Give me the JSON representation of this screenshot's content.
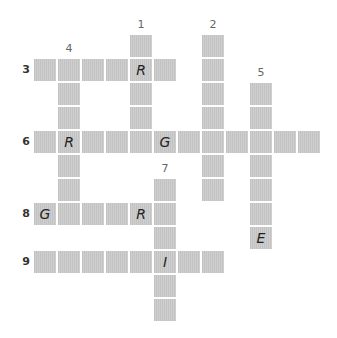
{
  "puzzle": {
    "grid": {
      "origin_x": 34,
      "origin_y": 35,
      "pitch": 24,
      "cell_size": 22
    },
    "colors": {
      "cell": "#c9c9c9",
      "letter": "#222222",
      "number": "#666666"
    },
    "entries": [
      {
        "number": "1",
        "direction": "down",
        "row": 0,
        "col": 4,
        "length": 5,
        "letters": {
          "1": "R"
        }
      },
      {
        "number": "2",
        "direction": "down",
        "row": 0,
        "col": 7,
        "length": 7,
        "letters": {}
      },
      {
        "number": "3",
        "direction": "across",
        "row": 1,
        "col": 0,
        "length": 6,
        "letters": {
          "4": "R"
        }
      },
      {
        "number": "4",
        "direction": "down",
        "row": 1,
        "col": 1,
        "length": 7,
        "letters": {
          "3": "R"
        }
      },
      {
        "number": "5",
        "direction": "down",
        "row": 2,
        "col": 9,
        "length": 7,
        "letters": {
          "6": "E"
        }
      },
      {
        "number": "6",
        "direction": "across",
        "row": 4,
        "col": 0,
        "length": 12,
        "letters": {
          "1": "R",
          "5": "G"
        }
      },
      {
        "number": "7",
        "direction": "down",
        "row": 6,
        "col": 5,
        "length": 6,
        "letters": {
          "3": "I"
        }
      },
      {
        "number": "8",
        "direction": "across",
        "row": 7,
        "col": 0,
        "length": 6,
        "letters": {
          "0": "G",
          "4": "R"
        }
      },
      {
        "number": "9",
        "direction": "across",
        "row": 9,
        "col": 0,
        "length": 8,
        "letters": {
          "5": "I"
        }
      }
    ]
  }
}
